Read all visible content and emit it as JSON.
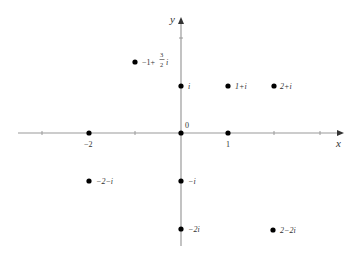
{
  "diagram": {
    "axes": {
      "x_label": "x",
      "y_label": "y",
      "origin_label": "0",
      "x_tick_labels": [
        {
          "value": -2,
          "text": "−2"
        },
        {
          "value": 1,
          "text": "1"
        }
      ],
      "color": "#999999"
    },
    "points": [
      {
        "re": -1,
        "im": 1.5,
        "label_prefix": "−1+",
        "frac_num": "3",
        "frac_den": "2",
        "label_suffix": "i"
      },
      {
        "re": 0,
        "im": 1,
        "label": "i"
      },
      {
        "re": 1,
        "im": 1,
        "label": "1+i"
      },
      {
        "re": 2,
        "im": 1,
        "label": "2+i"
      },
      {
        "re": -2,
        "im": 0,
        "label": ""
      },
      {
        "re": 0,
        "im": 0,
        "label": ""
      },
      {
        "re": 1,
        "im": 0,
        "label": ""
      },
      {
        "re": -2,
        "im": -1,
        "label": "−2−i"
      },
      {
        "re": 0,
        "im": -1,
        "label": "−i"
      },
      {
        "re": 0,
        "im": -2,
        "label": "−2i"
      },
      {
        "re": 2,
        "im": -2,
        "label": "2−2i"
      }
    ],
    "point_color": "#000000"
  }
}
